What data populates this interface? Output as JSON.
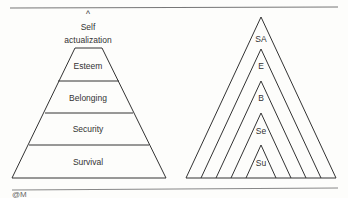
{
  "left_pyramid": {
    "top_label_line1": "Self",
    "top_label_line2": "actualization",
    "caret": "^",
    "levels": [
      "Esteem",
      "Belonging",
      "Security",
      "Survival"
    ]
  },
  "right_pyramid": {
    "labels": [
      "SA",
      "E",
      "B",
      "Se",
      "Su"
    ]
  },
  "footer_mark": "@M"
}
